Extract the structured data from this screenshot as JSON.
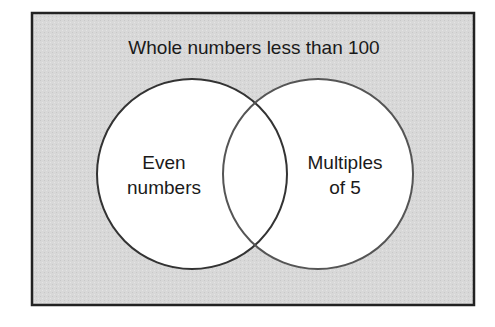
{
  "diagram": {
    "type": "venn",
    "universal_set": {
      "label": "Whole numbers less than 100",
      "fill": "#d9d9d9",
      "border": "#222222"
    },
    "sets": [
      {
        "id": "even",
        "line1": "Even",
        "line2": "numbers",
        "fill": "#ffffff",
        "stroke": "#333333"
      },
      {
        "id": "mult5",
        "line1": "Multiples",
        "line2": "of 5",
        "fill": "#ffffff",
        "stroke": "#555555"
      }
    ]
  }
}
